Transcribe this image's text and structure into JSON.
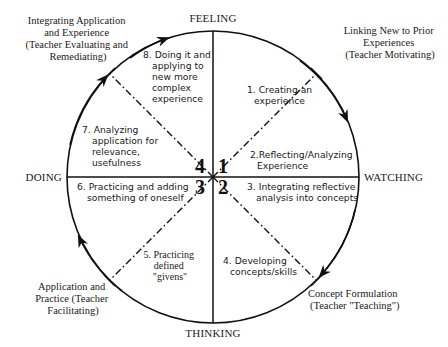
{
  "axes": {
    "top": "FEELING",
    "right": "WATCHING",
    "bottom": "THINKING",
    "left": "DOING"
  },
  "corners": {
    "top_left": [
      "Integrating Application",
      "and Experience",
      "(Teacher Evaluating and",
      "Remediating)"
    ],
    "top_right": [
      "Linking New to Prior",
      "Experiences",
      "(Teacher Motivating)"
    ],
    "bottom_left": [
      "Application and",
      "Practice (Teacher",
      "Facilitating)"
    ],
    "bottom_right": [
      "Concept Formulation",
      "(Teacher \"Teaching\")"
    ]
  },
  "steps": [
    {
      "lines": [
        "1. Creating an",
        "experience"
      ]
    },
    {
      "lines": [
        "2.Reflecting/Analyzing",
        "Experience"
      ]
    },
    {
      "lines": [
        "3. Integrating reflective",
        "analysis into concepts"
      ]
    },
    {
      "lines": [
        "4. Developing",
        "concepts/skills"
      ]
    },
    {
      "lines": [
        "5. Practicing",
        "defined",
        "\"givens\""
      ]
    },
    {
      "lines": [
        "6. Practicing and adding",
        "something of oneself"
      ]
    },
    {
      "lines": [
        "7. Analyzing",
        "application for",
        "relevance,",
        "usefulness"
      ]
    },
    {
      "lines": [
        "8. Doing it and",
        "applying to",
        "new more",
        "complex",
        "experience"
      ]
    }
  ],
  "quadrants": {
    "q1": "1",
    "q2": "2",
    "q3": "3",
    "q4": "4"
  },
  "colors": {
    "stroke": "#111111",
    "background": "#ffffff"
  }
}
